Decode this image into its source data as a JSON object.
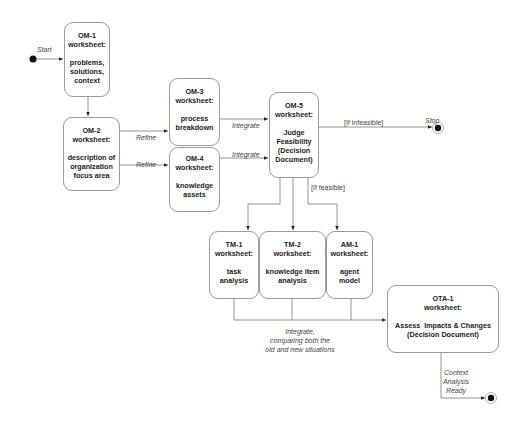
{
  "diagram": {
    "start_label": "Start",
    "stop_label": "Stop",
    "boxes": {
      "om1": {
        "id": "OM-1",
        "kind": "worksheet:",
        "lines": [
          "problems,",
          "solutions,",
          "context"
        ]
      },
      "om2": {
        "id": "OM-2",
        "kind": "worksheet:",
        "lines": [
          "description of",
          "organization",
          "focus area"
        ]
      },
      "om3": {
        "id": "OM-3",
        "kind": "worksheet:",
        "lines": [
          "process",
          "breakdown"
        ]
      },
      "om4": {
        "id": "OM-4",
        "kind": "worksheet:",
        "lines": [
          "knowledge",
          "assets"
        ]
      },
      "om5": {
        "id": "OM-5",
        "kind": "worksheet:",
        "lines": [
          "Judge",
          "Feasibility",
          "(Decision",
          "Document)"
        ]
      },
      "tm1": {
        "id": "TM-1",
        "kind": "worksheet:",
        "lines": [
          "task",
          "analysis"
        ]
      },
      "tm2": {
        "id": "TM-2",
        "kind": "worksheet:",
        "lines": [
          "knowledge item",
          "analysis"
        ]
      },
      "am1": {
        "id": "AM-1",
        "kind": "worksheet:",
        "lines": [
          "agent",
          "model"
        ]
      },
      "ota1": {
        "id": "OTA-1",
        "kind": "worksheet:",
        "lines": [
          "Assess  Impacts & Changes",
          "(Decision Document)"
        ]
      }
    },
    "edge_labels": {
      "refine_1": "Refine",
      "refine_2": "Refine",
      "integrate_1": "Integrate",
      "integrate_2": "Integrate",
      "if_infeasible": "[If infeasible]",
      "if_feasible": "[If feasible]",
      "integrate_compare": [
        "Integrate,",
        "comparing both the",
        "old and new situations"
      ],
      "context_ready": [
        "Context",
        "Analysis",
        "Ready"
      ]
    },
    "colors": {
      "line": "#888888",
      "border": "#9a9a9a",
      "text": "#222222",
      "label": "#444444"
    }
  }
}
